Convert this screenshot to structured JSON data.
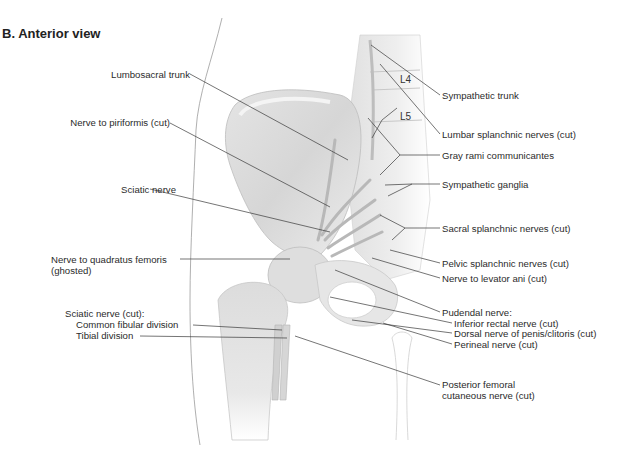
{
  "figure": {
    "title": "B. Anterior view",
    "vertebrae": [
      "L4",
      "L5"
    ],
    "labels_left": {
      "lumbosacral_trunk": "Lumbosacral trunk",
      "nerve_to_piriformis": "Nerve to piriformis (cut)",
      "sciatic_nerve": "Sciatic nerve",
      "nerve_to_quadratus_line1": "Nerve to quadratus femoris",
      "nerve_to_quadratus_line2": "(ghosted)",
      "sciatic_cut": "Sciatic nerve (cut):",
      "common_fibular": "Common fibular division",
      "tibial": "Tibial division"
    },
    "labels_right": {
      "sympathetic_trunk": "Sympathetic trunk",
      "lumbar_splanchnic": "Lumbar splanchnic nerves (cut)",
      "gray_rami": "Gray rami communicantes",
      "sympathetic_ganglia": "Sympathetic ganglia",
      "sacral_splanchnic": "Sacral splanchnic nerves (cut)",
      "pelvic_splanchnic": "Pelvic splanchnic nerves (cut)",
      "nerve_to_levator_ani": "Nerve to levator ani (cut)",
      "pudendal": "Pudendal nerve:",
      "inferior_rectal": "Inferior rectal nerve (cut)",
      "dorsal_nerve": "Dorsal nerve of penis/clitoris (cut)",
      "perineal": "Perineal nerve (cut)",
      "posterior_femoral_line1": "Posterior femoral",
      "posterior_femoral_line2": "cutaneous nerve (cut)"
    }
  }
}
